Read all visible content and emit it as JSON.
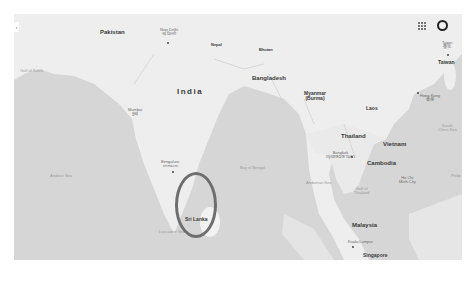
{
  "map": {
    "style": "grayscale",
    "colors": {
      "land": "#eeeeee",
      "water": "#d6d6d6",
      "highlight_ring": "#6e6e6e"
    },
    "controls": {
      "left_toggle": "‹",
      "apps_icon": "apps-grid-icon",
      "account_icon": "account-icon"
    },
    "countries": {
      "pakistan": "Pakistan",
      "india": "India",
      "nepal": "Nepal",
      "bhutan": "Bhutan",
      "bangladesh": "Bangladesh",
      "myanmar": "Myanmar",
      "myanmar_alt": "(Burma)",
      "laos": "Laos",
      "thailand": "Thailand",
      "vietnam": "Vietnam",
      "cambodia": "Cambodia",
      "taiwan": "Taiwan",
      "malaysia": "Malaysia",
      "singapore": "Singapore",
      "sri_lanka": "Sri Lanka"
    },
    "cities": {
      "new_delhi": "New Delhi",
      "new_delhi_local": "नई दिल्ली",
      "mumbai": "Mumbai",
      "mumbai_local": "मुंबई",
      "bengaluru": "Bengaluru",
      "bengaluru_local": "ಬೆಂಗಳೂರು",
      "bangkok": "Bangkok",
      "bangkok_local": "กรุงเทพมหานคร",
      "ho_chi_minh": "Ho Chi",
      "ho_chi_minh_2": "Minh City",
      "hong_kong": "Hong Kong",
      "hong_kong_local": "香港",
      "taipei": "Taipei",
      "taipei_local": "臺北",
      "kuala_lumpur": "Kuala Lumpur"
    },
    "seas": {
      "gulf_of_kutch": "Gulf of Kutch",
      "arabian_sea": "Arabian Sea",
      "bay_of_bengal": "Bay of Bengal",
      "andaman_sea": "Andaman Sea",
      "laccadive_sea": "Laccadive Sea",
      "gulf_of_thailand": "Gulf of",
      "gulf_of_thailand_2": "Thailand",
      "south_china_sea": "South",
      "south_china_sea_2": "China Sea",
      "philippines_partial": "Philip"
    },
    "annotation": {
      "highlighted_region": "Sri Lanka",
      "shape": "ellipse"
    }
  }
}
